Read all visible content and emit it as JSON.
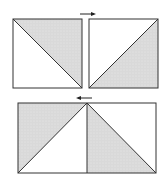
{
  "diagram": {
    "colors": {
      "stroke": "#333333",
      "shaded": "#d9d9d9",
      "background": "#ffffff",
      "arrow": "#222222"
    },
    "top_row": {
      "left_square": {
        "x": 13,
        "y": 19,
        "size": 69,
        "diagonal": "top-left to bottom-right",
        "shaded_half": "upper-right"
      },
      "right_square": {
        "x": 89,
        "y": 19,
        "size": 69,
        "diagonal": "bottom-left to top-right",
        "shaded_half": "lower-right"
      },
      "arrow": {
        "direction": "right",
        "x1": 80,
        "x2": 96,
        "y": 14
      }
    },
    "bottom_row": {
      "rectangle": {
        "x": 18,
        "y": 103,
        "width": 138,
        "height": 70,
        "seam_x": 87
      },
      "left_half": {
        "diagonal": "bottom-left to top-right",
        "shaded_half": "upper-left"
      },
      "right_half": {
        "diagonal": "top-left to bottom-right",
        "shaded_half": "lower-left"
      },
      "arrow": {
        "direction": "left",
        "x1": 76,
        "x2": 92,
        "y": 98
      }
    }
  }
}
